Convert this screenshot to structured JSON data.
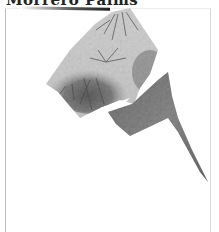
{
  "page": {
    "title": "Morrero Palms"
  },
  "image": {
    "subject": "palm-trees-photo",
    "style": "shattered-polygon-fragment",
    "tone": "grayscale"
  },
  "colors": {
    "background": "#ffffff",
    "frame_border": "#bdbdbd",
    "foliage_dark": "#3a3a3a",
    "foliage_mid": "#8a8a8a",
    "sky": "#f2f2f2"
  }
}
